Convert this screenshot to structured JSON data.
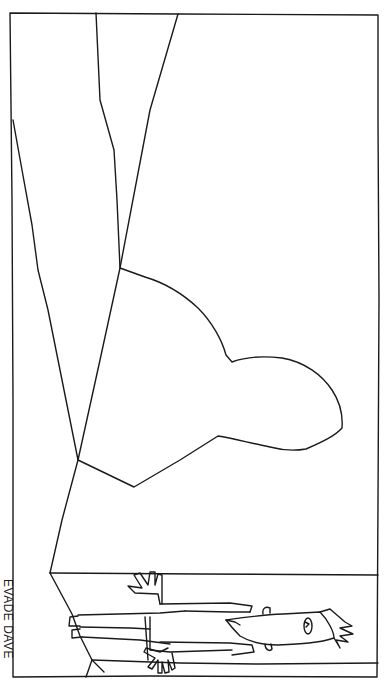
{
  "cartoon": {
    "caption": "EVADE DAVE",
    "caption_orientation": "rotated 90deg clockwise along left edge",
    "stroke_color": "#1a1a1a",
    "background_color": "#ffffff",
    "elements": [
      "frame",
      "room-walls",
      "blob-shadow",
      "lying-man"
    ]
  }
}
